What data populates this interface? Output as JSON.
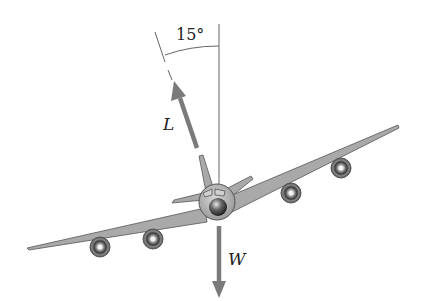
{
  "diagram": {
    "angle_label": "15°",
    "lift_label": "L",
    "weight_label": "W",
    "colors": {
      "arrow": "#7a7a7a",
      "line": "#666666",
      "wing": "#a9a9a9",
      "wing_edge": "#555555",
      "fuselage": "#b5b5b5",
      "engine_dark": "#3a3a3a"
    }
  }
}
